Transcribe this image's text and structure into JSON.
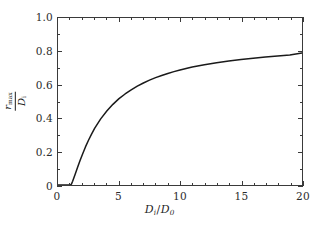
{
  "figure": {
    "background_color": "#ffffff",
    "frame_color": "#3a3a3a",
    "curve_color": "#1a1a1a"
  },
  "axes": {
    "x": {
      "label_numerator": "D",
      "label_numerator_sub": "i",
      "label_slash": "/",
      "label_denominator": "D",
      "label_denominator_sub": "0",
      "ticks": [
        "0",
        "5",
        "10",
        "15",
        "20"
      ],
      "tick_values": [
        0,
        5,
        10,
        15,
        20
      ],
      "minor_interval": 1,
      "range": [
        0,
        20
      ]
    },
    "y": {
      "label_numerator": "r",
      "label_numerator_sub": "max",
      "label_denominator": "D",
      "label_denominator_sub": "i",
      "ticks": [
        "0",
        "0.2",
        "0.4",
        "0.6",
        "0.8",
        "1.0"
      ],
      "tick_values": [
        0,
        0.2,
        0.4,
        0.6,
        0.8,
        1.0
      ],
      "minor_interval": 0.1,
      "range": [
        0,
        1.0
      ]
    }
  },
  "chart_data": {
    "type": "line",
    "title": "",
    "xlabel": "D_i/D_0",
    "ylabel": "r_max/D_i",
    "xlim": [
      0,
      20
    ],
    "ylim": [
      0,
      1.0
    ],
    "grid": false,
    "legend": null,
    "series": [
      {
        "name": "r_max/D_i",
        "x": [
          0,
          0.2,
          0.4,
          0.6,
          0.8,
          1.0,
          1.1,
          1.2,
          1.4,
          1.6,
          1.8,
          2.0,
          2.25,
          2.5,
          2.75,
          3.0,
          3.5,
          4.0,
          4.5,
          5.0,
          5.5,
          6.0,
          6.5,
          7.0,
          7.5,
          8.0,
          8.5,
          9.0,
          9.5,
          10.0,
          11.0,
          12.0,
          13.0,
          14.0,
          15.0,
          16.0,
          17.0,
          18.0,
          19.0,
          20.0
        ],
        "y": [
          0,
          0,
          0,
          0,
          0,
          0,
          0.005,
          0.022,
          0.063,
          0.105,
          0.145,
          0.183,
          0.228,
          0.268,
          0.305,
          0.339,
          0.396,
          0.443,
          0.483,
          0.517,
          0.545,
          0.57,
          0.592,
          0.611,
          0.628,
          0.643,
          0.656,
          0.668,
          0.679,
          0.689,
          0.706,
          0.72,
          0.732,
          0.742,
          0.751,
          0.759,
          0.766,
          0.773,
          0.779,
          0.79
        ]
      }
    ]
  }
}
